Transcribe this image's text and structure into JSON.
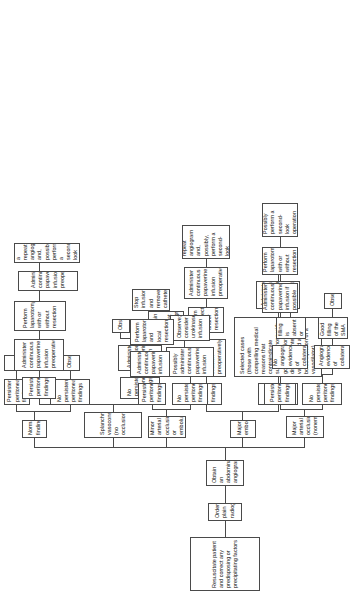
{
  "figure": {
    "type": "flowchart",
    "orientation": "rotated-90-ccw",
    "box_border_color": "#4a4a4a",
    "background_color": "#ffffff"
  },
  "nodes": {
    "resuscitate": "Resuscitate patient and correct any predisposing or precipitating factors",
    "plain_radiographs": "Order plain radiographs",
    "angiogram": "Obtain an abdominal angiogram",
    "normal_findings": "Normal findings",
    "nf_no_persistent": "No persistent peritoneal findings",
    "nf_persistent": "Persistent peritoneal findings",
    "nf_observe": "Observe",
    "nf_laparotomy": "Perform laparotomy",
    "splanchnic": "Splanchnic vasoconstriction (no occlusion)",
    "sv_no_persistent": "No persistent peritoneal findings",
    "sv_persistent": "Persistent peritoneal findings",
    "sv_papaverine": "Administer continuous papaverine infusion",
    "sv_papaverine_preop": "Administer continuous papaverine infusion preoperatively",
    "sv_observe": "Observe",
    "sv_repeat_angio": "Obtain a repeat angiogram",
    "sv_laparotomy": "Perform laparotomy with or without resection",
    "sv_papaverine_preop2": "Administer continuous papaverine infusion preoperatively",
    "sv_repeat_secondlook": "Obtain a repeat angiogram and, possibly, perform a second-look operation",
    "major_embolus": "Major embolus",
    "me_no_persistent": "No persistent peritoneal findings",
    "me_persistent": "Persistent peritoneal findings",
    "me_selected_cases": "Selected cases (those with compelling medical reasons that contraindicate surgery or those with good perfusion of the distal mesenteric vascular bed after bolus injection of a vasodilator)",
    "me_papaverine_preop": "Administer continuous papaverine infusion preoperatively",
    "me_embolectomy": "Perform embolectomy and/or resection",
    "me_papaverine_preop2": "Administer continuous papaverine infusion preoperatively",
    "me_repeat_secondlook": "Obtain a repeat angiogram and, possibly, perform a second-look operation",
    "me_papaverine_preop3": "Administer continuous papaverine infusion preoperatively",
    "me_repeat_angio": "Obtain a repeat angiogram",
    "minor_arterial": "Minor arterial occlusion or embolus",
    "ma_no_persistent": "No persistent peritoneal findings",
    "ma_persistent": "Persistent peritoneal findings",
    "ma_possibly_papaverine": "Possibly administer continuous papaverine infusion",
    "ma_observe_urokinase": "Observe; consider urokinase infusion",
    "ma_papaverine": "Administer continuous papaverine infusion",
    "ma_laparotomy_local": "Perform laparotomy and local resection",
    "ma_stop_infusion": "Stop infusion and remove catheter",
    "major_arterial": "Major arterial occlusion (nonembolic)",
    "mao_no_persistent": "No persistent peritoneal findings",
    "mao_persistent": "Persistent peritoneal findings",
    "mao_no_collaterals": "No angiographic evidence of collaterals",
    "mao_collaterals": "Angiographic evidence of collaterals",
    "mao_sma_absent": "SMA filling is absent or poor",
    "mao_good_filling": "Good filling of the SMA",
    "mao_papaverine_if_possible": "Administer continuous papaverine infusion if possible",
    "mao_observe": "Observe",
    "mao_laparotomy": "Perform laparotomy with or without resection",
    "mao_secondlook": "Possibly perform a second-look operation"
  }
}
